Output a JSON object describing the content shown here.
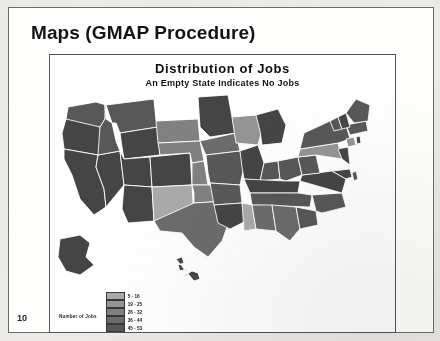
{
  "slide": {
    "title": "Maps (GMAP Procedure)",
    "number": "10"
  },
  "chart_data": {
    "type": "map",
    "map_kind": "choropleth",
    "region": "United States",
    "title": "Distribution of Jobs",
    "subtitle": "An Empty State Indicates No Jobs",
    "legend_title": "Number of Jobs",
    "legend_position": "bottom",
    "empty_value_note": "An Empty State Indicates No Jobs",
    "empty_color": "#ffffff",
    "bins": [
      {
        "label": "5 - 16",
        "color": "#a8a8a8"
      },
      {
        "label": "19 - 25",
        "color": "#949494"
      },
      {
        "label": "26 - 32",
        "color": "#818181"
      },
      {
        "label": "36 - 44",
        "color": "#6d6d6d"
      },
      {
        "label": "45 - 53",
        "color": "#5a5a5a"
      },
      {
        "label": "59 - 107",
        "color": "#474747"
      }
    ],
    "states": [
      {
        "code": "WA",
        "name": "Washington",
        "bin": 4,
        "color": "#5a5a5a"
      },
      {
        "code": "OR",
        "name": "Oregon",
        "bin": 5,
        "color": "#474747"
      },
      {
        "code": "CA",
        "name": "California",
        "bin": 5,
        "color": "#474747"
      },
      {
        "code": "NV",
        "name": "Nevada",
        "bin": 5,
        "color": "#474747"
      },
      {
        "code": "ID",
        "name": "Idaho",
        "bin": 4,
        "color": "#5a5a5a"
      },
      {
        "code": "MT",
        "name": "Montana",
        "bin": 4,
        "color": "#5a5a5a"
      },
      {
        "code": "WY",
        "name": "Wyoming",
        "bin": 5,
        "color": "#474747"
      },
      {
        "code": "UT",
        "name": "Utah",
        "bin": 5,
        "color": "#474747"
      },
      {
        "code": "AZ",
        "name": "Arizona",
        "bin": 5,
        "color": "#474747"
      },
      {
        "code": "CO",
        "name": "Colorado",
        "bin": 5,
        "color": "#474747"
      },
      {
        "code": "NM",
        "name": "New Mexico",
        "bin": 0,
        "color": "#a8a8a8"
      },
      {
        "code": "ND",
        "name": "North Dakota",
        "bin": null,
        "color": "#ffffff"
      },
      {
        "code": "SD",
        "name": "South Dakota",
        "bin": 2,
        "color": "#818181"
      },
      {
        "code": "NE",
        "name": "Nebraska",
        "bin": 2,
        "color": "#818181"
      },
      {
        "code": "KS",
        "name": "Kansas",
        "bin": 2,
        "color": "#818181"
      },
      {
        "code": "OK",
        "name": "Oklahoma",
        "bin": 2,
        "color": "#818181"
      },
      {
        "code": "TX",
        "name": "Texas",
        "bin": 3,
        "color": "#6d6d6d"
      },
      {
        "code": "MN",
        "name": "Minnesota",
        "bin": 5,
        "color": "#474747"
      },
      {
        "code": "IA",
        "name": "Iowa",
        "bin": 3,
        "color": "#6d6d6d"
      },
      {
        "code": "MO",
        "name": "Missouri",
        "bin": 4,
        "color": "#5a5a5a"
      },
      {
        "code": "AR",
        "name": "Arkansas",
        "bin": 4,
        "color": "#5a5a5a"
      },
      {
        "code": "LA",
        "name": "Louisiana",
        "bin": 5,
        "color": "#474747"
      },
      {
        "code": "WI",
        "name": "Wisconsin",
        "bin": 1,
        "color": "#949494"
      },
      {
        "code": "IL",
        "name": "Illinois",
        "bin": 5,
        "color": "#474747"
      },
      {
        "code": "MI",
        "name": "Michigan",
        "bin": 5,
        "color": "#474747"
      },
      {
        "code": "IN",
        "name": "Indiana",
        "bin": 4,
        "color": "#5a5a5a"
      },
      {
        "code": "OH",
        "name": "Ohio",
        "bin": 4,
        "color": "#5a5a5a"
      },
      {
        "code": "KY",
        "name": "Kentucky",
        "bin": 5,
        "color": "#474747"
      },
      {
        "code": "TN",
        "name": "Tennessee",
        "bin": 4,
        "color": "#5a5a5a"
      },
      {
        "code": "MS",
        "name": "Mississippi",
        "bin": 0,
        "color": "#a8a8a8"
      },
      {
        "code": "AL",
        "name": "Alabama",
        "bin": 3,
        "color": "#6d6d6d"
      },
      {
        "code": "GA",
        "name": "Georgia",
        "bin": 3,
        "color": "#6d6d6d"
      },
      {
        "code": "FL",
        "name": "Florida",
        "bin": null,
        "color": "#ffffff"
      },
      {
        "code": "SC",
        "name": "South Carolina",
        "bin": 4,
        "color": "#5a5a5a"
      },
      {
        "code": "NC",
        "name": "North Carolina",
        "bin": 4,
        "color": "#5a5a5a"
      },
      {
        "code": "VA",
        "name": "Virginia",
        "bin": 5,
        "color": "#474747"
      },
      {
        "code": "WV",
        "name": "West Virginia",
        "bin": 4,
        "color": "#5a5a5a"
      },
      {
        "code": "MD",
        "name": "Maryland",
        "bin": 5,
        "color": "#474747"
      },
      {
        "code": "DE",
        "name": "Delaware",
        "bin": 4,
        "color": "#5a5a5a"
      },
      {
        "code": "PA",
        "name": "Pennsylvania",
        "bin": 1,
        "color": "#949494"
      },
      {
        "code": "NJ",
        "name": "New Jersey",
        "bin": 5,
        "color": "#474747"
      },
      {
        "code": "NY",
        "name": "New York",
        "bin": 4,
        "color": "#5a5a5a"
      },
      {
        "code": "CT",
        "name": "Connecticut",
        "bin": 1,
        "color": "#949494"
      },
      {
        "code": "RI",
        "name": "Rhode Island",
        "bin": 5,
        "color": "#474747"
      },
      {
        "code": "MA",
        "name": "Massachusetts",
        "bin": 4,
        "color": "#5a5a5a"
      },
      {
        "code": "VT",
        "name": "Vermont",
        "bin": 4,
        "color": "#5a5a5a"
      },
      {
        "code": "NH",
        "name": "New Hampshire",
        "bin": 5,
        "color": "#474747"
      },
      {
        "code": "ME",
        "name": "Maine",
        "bin": 4,
        "color": "#5a5a5a"
      },
      {
        "code": "AK",
        "name": "Alaska",
        "bin": 5,
        "color": "#474747"
      },
      {
        "code": "HI",
        "name": "Hawaii",
        "bin": 5,
        "color": "#474747"
      }
    ]
  }
}
